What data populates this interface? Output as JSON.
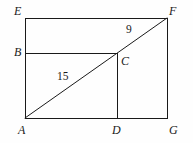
{
  "figure": {
    "type": "geometry-diagram",
    "canvas": {
      "width": 193,
      "height": 143
    },
    "stroke_color": "#1a1a1a",
    "background_color": "#fefefe",
    "stroke_width": 1,
    "vertices": {
      "A": {
        "label": "A",
        "x": 25,
        "y": 118,
        "label_x": 18,
        "label_y": 124,
        "style": "italic"
      },
      "B": {
        "label": "B",
        "x": 25,
        "y": 53,
        "label_x": 14,
        "label_y": 46,
        "style": "italic"
      },
      "C": {
        "label": "C",
        "x": 117,
        "y": 53,
        "label_x": 121,
        "label_y": 55,
        "style": "italic"
      },
      "D": {
        "label": "D",
        "x": 117,
        "y": 118,
        "label_x": 112,
        "label_y": 124,
        "style": "italic"
      },
      "E": {
        "label": "E",
        "x": 25,
        "y": 18,
        "label_x": 14,
        "label_y": 5,
        "style": "italic"
      },
      "F": {
        "label": "F",
        "x": 167,
        "y": 18,
        "label_x": 169,
        "label_y": 5,
        "style": "italic"
      },
      "G": {
        "label": "G",
        "x": 167,
        "y": 118,
        "label_x": 169,
        "label_y": 124,
        "style": "italic"
      }
    },
    "segments": [
      {
        "name": "rectangle-left-side-AE",
        "from": "A",
        "to": "E"
      },
      {
        "name": "rectangle-top-side-EF",
        "from": "E",
        "to": "F"
      },
      {
        "name": "rectangle-right-side-FG",
        "from": "F",
        "to": "G"
      },
      {
        "name": "rectangle-bottom-side-AG",
        "from": "A",
        "to": "G"
      },
      {
        "name": "horizontal-segment-BC",
        "from": "B",
        "to": "C"
      },
      {
        "name": "vertical-segment-CD",
        "from": "C",
        "to": "D"
      },
      {
        "name": "diagonal-AF",
        "from": "A",
        "to": "F"
      }
    ],
    "measurements": [
      {
        "name": "length-AC",
        "value": "15",
        "segment": "A-C",
        "x": 57,
        "y": 71,
        "style": "upright"
      },
      {
        "name": "length-CF",
        "value": "9",
        "segment": "C-F",
        "x": 126,
        "y": 24,
        "style": "upright"
      }
    ]
  }
}
